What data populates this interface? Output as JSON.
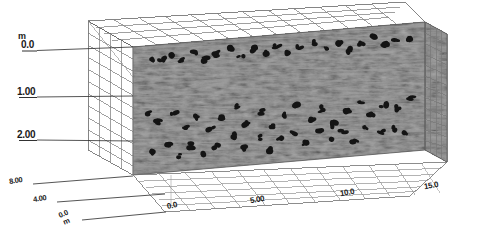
{
  "figure": {
    "type": "3d-volume-slice",
    "background_color": "#ffffff",
    "panel_fill_color": "#808080",
    "wireframe_color": "#6e6e6e",
    "blob_color": "#141414",
    "text_color": "#1a1a1a"
  },
  "axes": {
    "vertical": {
      "unit_label": "m",
      "ticks": [
        "0.0",
        "1.00",
        "2.00"
      ],
      "values": [
        0.0,
        1.0,
        2.0
      ],
      "direction": "depth-downward"
    },
    "depth_left": {
      "ticks": [
        "8.00",
        "4.00"
      ],
      "values": [
        8.0,
        4.0
      ]
    },
    "origin": {
      "value_label": "0.0",
      "unit_label": "m"
    },
    "horizontal": {
      "ticks": [
        "0.0",
        "5.00",
        "10.0",
        "15.0"
      ],
      "values": [
        0.0,
        5.0,
        10.0,
        15.0
      ]
    }
  },
  "chart_data": {
    "type": "heatmap",
    "title": "",
    "xlabel": "m",
    "ylabel": "m",
    "zlabel": "m",
    "xlim": [
      0.0,
      15.0
    ],
    "ylim": [
      0.0,
      8.0
    ],
    "zlim": [
      0.0,
      2.0
    ],
    "xticks": [
      0.0,
      5.0,
      10.0,
      15.0
    ],
    "yticks": [
      8.0,
      4.0,
      0.0
    ],
    "zticks": [
      0.0,
      1.0,
      2.0
    ],
    "grid": true,
    "legend": "none",
    "anomalies": [
      [
        0.06,
        0.1
      ],
      [
        0.1,
        0.12
      ],
      [
        0.13,
        0.09
      ],
      [
        0.17,
        0.13
      ],
      [
        0.21,
        0.08
      ],
      [
        0.25,
        0.14
      ],
      [
        0.29,
        0.11
      ],
      [
        0.33,
        0.07
      ],
      [
        0.37,
        0.15
      ],
      [
        0.41,
        0.1
      ],
      [
        0.45,
        0.13
      ],
      [
        0.49,
        0.09
      ],
      [
        0.53,
        0.16
      ],
      [
        0.57,
        0.11
      ],
      [
        0.62,
        0.08
      ],
      [
        0.66,
        0.14
      ],
      [
        0.7,
        0.1
      ],
      [
        0.74,
        0.17
      ],
      [
        0.78,
        0.12
      ],
      [
        0.82,
        0.09
      ],
      [
        0.86,
        0.15
      ],
      [
        0.9,
        0.11
      ],
      [
        0.94,
        0.13
      ],
      [
        0.05,
        0.52
      ],
      [
        0.09,
        0.6
      ],
      [
        0.14,
        0.55
      ],
      [
        0.18,
        0.66
      ],
      [
        0.22,
        0.58
      ],
      [
        0.27,
        0.7
      ],
      [
        0.31,
        0.62
      ],
      [
        0.35,
        0.54
      ],
      [
        0.39,
        0.68
      ],
      [
        0.44,
        0.59
      ],
      [
        0.48,
        0.72
      ],
      [
        0.52,
        0.63
      ],
      [
        0.56,
        0.56
      ],
      [
        0.61,
        0.69
      ],
      [
        0.65,
        0.61
      ],
      [
        0.69,
        0.74
      ],
      [
        0.73,
        0.64
      ],
      [
        0.78,
        0.57
      ],
      [
        0.82,
        0.7
      ],
      [
        0.86,
        0.62
      ],
      [
        0.91,
        0.66
      ],
      [
        0.95,
        0.58
      ],
      [
        0.07,
        0.84
      ],
      [
        0.12,
        0.78
      ],
      [
        0.16,
        0.88
      ],
      [
        0.2,
        0.81
      ],
      [
        0.24,
        0.9
      ],
      [
        0.28,
        0.83
      ],
      [
        0.34,
        0.76
      ],
      [
        0.38,
        0.86
      ],
      [
        0.43,
        0.8
      ],
      [
        0.47,
        0.89
      ],
      [
        0.51,
        0.82
      ],
      [
        0.55,
        0.77
      ],
      [
        0.59,
        0.87
      ],
      [
        0.64,
        0.79
      ],
      [
        0.68,
        0.85
      ],
      [
        0.72,
        0.81
      ],
      [
        0.76,
        0.88
      ],
      [
        0.8,
        0.78
      ],
      [
        0.85,
        0.84
      ],
      [
        0.89,
        0.8
      ],
      [
        0.93,
        0.86
      ]
    ]
  }
}
